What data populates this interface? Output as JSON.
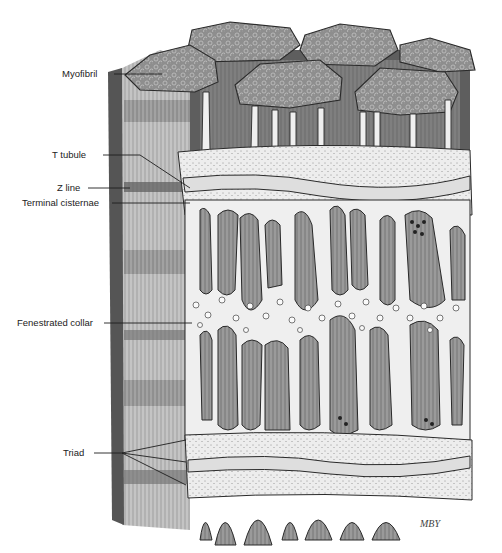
{
  "figure": {
    "artist_signature": "MBY",
    "labels": [
      {
        "id": "myofibril",
        "text": "Myofibril"
      },
      {
        "id": "t-tubule",
        "text": "T tubule"
      },
      {
        "id": "z-line",
        "text": "Z line"
      },
      {
        "id": "terminal-cisternae",
        "text": "Terminal cisternae"
      },
      {
        "id": "fenestrated-collar",
        "text": "Fenestrated collar"
      },
      {
        "id": "triad",
        "text": "Triad"
      }
    ]
  },
  "colors": {
    "background": "#ffffff",
    "myofibril_fill": "#8a8a8a",
    "myofibril_dark": "#4a4a4a",
    "reticulum_fill": "#ececec",
    "ink": "#1e1e1e",
    "label_text": "#222222"
  }
}
